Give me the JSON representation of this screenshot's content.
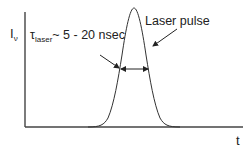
{
  "diagram": {
    "y_axis_label": {
      "symbol": "I",
      "subscript": "ν"
    },
    "x_axis_label": "t",
    "duration_label": {
      "symbol": "τ",
      "subscript": "laser",
      "text": "~ 5 - 20 nsec"
    },
    "pulse_label": "Laser pulse",
    "curve": {
      "type": "gaussian",
      "peak_x": 134,
      "peak_y": 8,
      "baseline_y": 127,
      "sigma_px": 13
    },
    "fwhm_marker": {
      "y": 69,
      "x_left": 121,
      "x_right": 148
    },
    "colors": {
      "line": "#333333",
      "axis": "#444444",
      "text": "#222222"
    }
  }
}
